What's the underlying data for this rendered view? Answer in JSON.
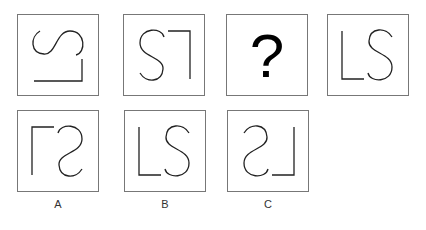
{
  "puzzle": {
    "sequence": [
      {
        "id": "seq-1",
        "glyph": "LS",
        "transform": "rotated 90deg counter-clockwise"
      },
      {
        "id": "seq-2",
        "glyph": "LS",
        "transform": "rotated 180deg"
      },
      {
        "id": "seq-3",
        "glyph": "?",
        "transform": "question mark"
      },
      {
        "id": "seq-4",
        "glyph": "LS",
        "transform": "upright"
      }
    ],
    "question_mark": "?",
    "options": [
      {
        "label": "A",
        "glyph": "LS",
        "transform": "mirrored"
      },
      {
        "label": "B",
        "glyph": "LS",
        "transform": "rotated 180deg mirrored"
      },
      {
        "label": "C",
        "glyph": "LS",
        "transform": "mirrored horizontally"
      }
    ]
  },
  "colors": {
    "stroke": "#222222",
    "border": "#777777"
  }
}
